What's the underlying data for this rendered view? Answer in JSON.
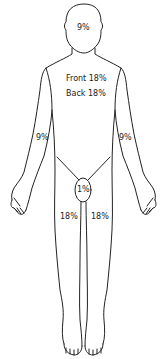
{
  "diagram": {
    "type": "rule-of-nines-body-chart",
    "line_color": "#222222",
    "background": "#ffffff",
    "labels": {
      "head": "9%",
      "trunk_front": "Front 18%",
      "trunk_back": "Back 18%",
      "right_arm": "9%",
      "left_arm": "9%",
      "genitals": "1%",
      "right_leg": "18%",
      "left_leg": "18%"
    }
  }
}
